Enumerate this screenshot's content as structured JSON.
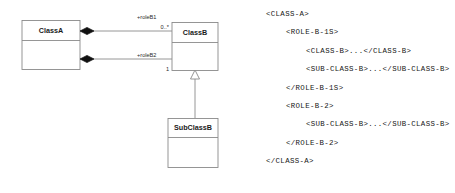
{
  "diagram": {
    "stroke_color": "#8a8a8a",
    "fill_color": "#ffffff",
    "diamond_color": "#111111",
    "classes": [
      {
        "id": "class-a",
        "name": "ClassA"
      },
      {
        "id": "class-b",
        "name": "ClassB"
      },
      {
        "id": "sub-class-b",
        "name": "SubClassB"
      }
    ],
    "associations": [
      {
        "id": "assoc-role-b1",
        "kind": "composition",
        "source": "ClassA",
        "target": "ClassB",
        "role_label": "+roleB1",
        "multiplicity": "0..*"
      },
      {
        "id": "assoc-role-b2",
        "kind": "composition",
        "source": "ClassA",
        "target": "ClassB",
        "role_label": "+roleB2",
        "multiplicity": "1"
      }
    ],
    "generalizations": [
      {
        "id": "gen-subclassb-classb",
        "kind": "generalization",
        "source": "SubClassB",
        "target": "ClassB"
      }
    ]
  },
  "xml_listing": {
    "lines": [
      {
        "indent": 0,
        "text": "<CLASS-A>"
      },
      {
        "indent": 1,
        "text": "<ROLE-B-1S>"
      },
      {
        "indent": 2,
        "text": "<CLASS-B>...</CLASS-B>"
      },
      {
        "indent": 2,
        "text": "<SUB-CLASS-B>...</SUB-CLASS-B>"
      },
      {
        "indent": 1,
        "text": "</ROLE-B-1S>"
      },
      {
        "indent": 1,
        "text": "<ROLE-B-2>"
      },
      {
        "indent": 2,
        "text": "<SUB-CLASS-B>...</SUB-CLASS-B>"
      },
      {
        "indent": 1,
        "text": "</ROLE-B-2>"
      },
      {
        "indent": 0,
        "text": "</CLASS-A>"
      }
    ]
  }
}
